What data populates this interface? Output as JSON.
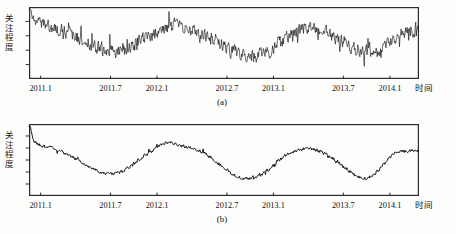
{
  "figure": {
    "background": "#fdfdfb",
    "line_color": "#0d0d0d",
    "axis_color": "#2b2b2b",
    "footnote": ""
  },
  "panels": [
    {
      "id": "a",
      "caption": "(a)",
      "ylabel": "关注程度",
      "xlabel": "时间",
      "x_tick_labels": [
        "2011.1",
        "2011.7",
        "2012.1",
        "2012.7",
        "2013.1",
        "2013.7",
        "2014.1"
      ],
      "y_tick_count": 4
    },
    {
      "id": "b",
      "caption": "(b)",
      "ylabel": "关注程度",
      "xlabel": "时间",
      "x_tick_labels": [
        "2011.1",
        "2011.7",
        "2012.1",
        "2012.7",
        "2013.1",
        "2013.7",
        "2014.1"
      ],
      "y_tick_count": 5
    }
  ],
  "chart_data": [
    {
      "type": "line",
      "title": "(a)",
      "subtitle": "",
      "xlabel": "时间",
      "ylabel": "关注程度",
      "grid": false,
      "legend": "none",
      "xlim": [
        2011.0,
        2014.35
      ],
      "ylim": [
        0,
        100
      ],
      "xtick_values": [
        2011.1,
        2011.7,
        2012.1,
        2012.7,
        2013.1,
        2013.7,
        2014.1
      ],
      "xtick_labels": [
        "2011.1",
        "2011.7",
        "2012.1",
        "2012.7",
        "2013.1",
        "2013.7",
        "2014.1"
      ],
      "ytick_labels": [
        "",
        "",
        "",
        ""
      ],
      "series": [
        {
          "name": "原始关注度",
          "noise_amplitude": 13,
          "x": [
            2011.0,
            2011.05,
            2011.1,
            2011.15,
            2011.2,
            2011.25,
            2011.3,
            2011.35,
            2011.4,
            2011.45,
            2011.5,
            2011.55,
            2011.6,
            2011.65,
            2011.7,
            2011.75,
            2011.8,
            2011.85,
            2011.9,
            2011.95,
            2012.0,
            2012.05,
            2012.1,
            2012.15,
            2012.2,
            2012.25,
            2012.3,
            2012.35,
            2012.4,
            2012.45,
            2012.5,
            2012.55,
            2012.6,
            2012.65,
            2012.7,
            2012.75,
            2012.8,
            2012.85,
            2012.9,
            2012.95,
            2013.0,
            2013.05,
            2013.1,
            2013.15,
            2013.2,
            2013.25,
            2013.3,
            2013.35,
            2013.4,
            2013.45,
            2013.5,
            2013.55,
            2013.6,
            2013.65,
            2013.7,
            2013.75,
            2013.8,
            2013.85,
            2013.9,
            2013.95,
            2014.0,
            2014.05,
            2014.1,
            2014.15,
            2014.2,
            2014.25,
            2014.3,
            2014.35
          ],
          "values": [
            86,
            80,
            76,
            74,
            72,
            70,
            67,
            63,
            59,
            55,
            50,
            46,
            43,
            41,
            40,
            40,
            41,
            44,
            48,
            52,
            56,
            60,
            65,
            69,
            73,
            75,
            72,
            69,
            67,
            64,
            61,
            57,
            53,
            48,
            43,
            38,
            34,
            31,
            30,
            31,
            34,
            38,
            43,
            49,
            57,
            63,
            66,
            68,
            70,
            71,
            69,
            66,
            62,
            57,
            52,
            47,
            43,
            40,
            38,
            37,
            39,
            44,
            51,
            58,
            63,
            66,
            67,
            66
          ]
        }
      ]
    },
    {
      "type": "line",
      "title": "(b)",
      "subtitle": "",
      "xlabel": "时间",
      "ylabel": "关注程度",
      "grid": false,
      "legend": "none",
      "xlim": [
        2011.0,
        2014.35
      ],
      "ylim": [
        0,
        100
      ],
      "xtick_values": [
        2011.1,
        2011.7,
        2012.1,
        2012.7,
        2013.1,
        2013.7,
        2014.1
      ],
      "xtick_labels": [
        "2011.1",
        "2011.7",
        "2012.1",
        "2012.7",
        "2013.1",
        "2013.7",
        "2014.1"
      ],
      "ytick_labels": [
        "",
        "",
        "",
        "",
        ""
      ],
      "series": [
        {
          "name": "平滑关注度",
          "noise_amplitude": 3,
          "x": [
            2011.0,
            2011.05,
            2011.1,
            2011.15,
            2011.2,
            2011.25,
            2011.3,
            2011.35,
            2011.4,
            2011.45,
            2011.5,
            2011.55,
            2011.6,
            2011.65,
            2011.7,
            2011.75,
            2011.8,
            2011.85,
            2011.9,
            2011.95,
            2012.0,
            2012.05,
            2012.1,
            2012.15,
            2012.2,
            2012.25,
            2012.3,
            2012.35,
            2012.4,
            2012.45,
            2012.5,
            2012.55,
            2012.6,
            2012.65,
            2012.7,
            2012.75,
            2012.8,
            2012.85,
            2012.9,
            2012.95,
            2013.0,
            2013.05,
            2013.1,
            2013.15,
            2013.2,
            2013.25,
            2013.3,
            2013.35,
            2013.4,
            2013.45,
            2013.5,
            2013.55,
            2013.6,
            2013.65,
            2013.7,
            2013.75,
            2013.8,
            2013.85,
            2013.9,
            2013.95,
            2014.0,
            2014.05,
            2014.1,
            2014.15,
            2014.2,
            2014.25,
            2014.3,
            2014.35
          ],
          "values": [
            92,
            74,
            70,
            69,
            67,
            64,
            60,
            56,
            52,
            47,
            42,
            38,
            34,
            32,
            31,
            32,
            34,
            39,
            45,
            51,
            57,
            62,
            68,
            72,
            75,
            73,
            70,
            68,
            67,
            64,
            60,
            55,
            49,
            42,
            36,
            30,
            26,
            24,
            24,
            26,
            30,
            36,
            43,
            50,
            56,
            60,
            63,
            65,
            66,
            65,
            62,
            58,
            53,
            47,
            41,
            35,
            30,
            26,
            25,
            28,
            35,
            45,
            55,
            61,
            63,
            62,
            63,
            61
          ]
        }
      ]
    }
  ]
}
